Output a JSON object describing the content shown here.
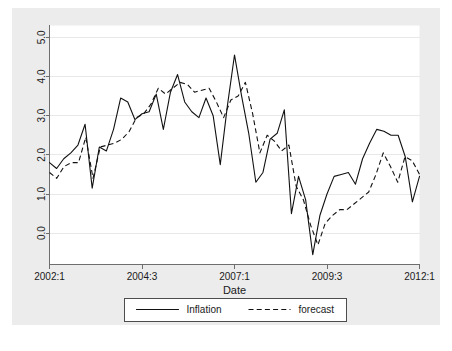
{
  "chart_data": {
    "type": "line",
    "title": "",
    "xlabel": "Date",
    "ylabel": "",
    "xlim": [
      0,
      40
    ],
    "ylim": [
      -0.8,
      5.2
    ],
    "grid": true,
    "legend_position": "bottom",
    "y_ticks": [
      "0.0",
      "1.0",
      "2.0",
      "3.0",
      "4.0",
      "5.0"
    ],
    "y_tick_values": [
      0.0,
      1.0,
      2.0,
      3.0,
      4.0,
      5.0
    ],
    "x_ticks": [
      "2002:1",
      "2004:3",
      "2007:1",
      "2009:3",
      "2012:1"
    ],
    "x_tick_values": [
      0,
      10,
      20,
      30,
      40
    ],
    "series": [
      {
        "name": "Inflation",
        "style": "solid",
        "x": [
          0,
          1,
          2,
          3,
          4,
          5,
          6,
          7,
          8,
          9,
          10,
          11,
          12,
          13,
          14,
          15,
          16,
          17,
          18,
          19,
          20,
          21,
          22,
          23,
          24,
          25,
          26,
          27,
          28,
          29,
          30,
          31,
          32,
          33,
          34,
          35,
          36,
          37,
          38,
          39,
          40
        ],
        "values": [
          1.8,
          1.65,
          1.9,
          2.05,
          2.25,
          2.78,
          1.15,
          2.2,
          2.1,
          2.65,
          3.45,
          3.35,
          2.9,
          3.05,
          3.1,
          3.55,
          2.65,
          3.6,
          4.05,
          3.35,
          3.1,
          2.95,
          3.45,
          3.0,
          1.75,
          3.25,
          4.55,
          3.5,
          2.55,
          1.3,
          1.55,
          2.4,
          2.55,
          3.15,
          0.5,
          1.45,
          0.85,
          -0.55,
          0.45,
          1.0,
          1.45
        ]
      },
      {
        "name": "forecast",
        "style": "dashed",
        "x": [
          0,
          1,
          2,
          3,
          4,
          5,
          6,
          7,
          8,
          9,
          10,
          11,
          12,
          13,
          14,
          15,
          16,
          17,
          18,
          19,
          20,
          21,
          22,
          23,
          24,
          25,
          26,
          27,
          28,
          29,
          30,
          31,
          32,
          33,
          34,
          35,
          36,
          37,
          38,
          39,
          40
        ],
        "values": [
          1.55,
          1.4,
          1.7,
          1.8,
          1.8,
          2.45,
          1.4,
          2.2,
          2.25,
          2.3,
          2.4,
          2.6,
          2.95,
          3.05,
          3.3,
          3.7,
          3.55,
          3.7,
          3.85,
          3.8,
          3.6,
          3.65,
          3.7,
          3.35,
          2.95,
          3.4,
          3.5,
          3.85,
          3.05,
          2.05,
          2.5,
          2.35,
          2.1,
          2.25,
          1.2,
          0.85,
          0.2,
          -0.3,
          0.25,
          0.45,
          0.6
        ]
      }
    ],
    "series_tail": {
      "note_solid": [
        1.5,
        1.55,
        1.25,
        1.9,
        2.3,
        2.65,
        2.6,
        2.5,
        2.5,
        1.95,
        0.8,
        1.45
      ],
      "note_dashed": [
        0.6,
        0.75,
        0.9,
        1.05,
        1.5,
        2.05,
        1.7,
        1.3,
        1.95,
        1.85,
        1.5
      ]
    },
    "legend": [
      {
        "label": "Inflation",
        "style": "solid"
      },
      {
        "label": "forecast",
        "style": "dashed"
      }
    ]
  },
  "colors": {
    "panel_background": "#ececec",
    "plot_background": "#ffffff",
    "gridline": "#e8e8e8",
    "axis": "#6e6e6e",
    "line": "#111111",
    "text": "#1a1a1a"
  }
}
